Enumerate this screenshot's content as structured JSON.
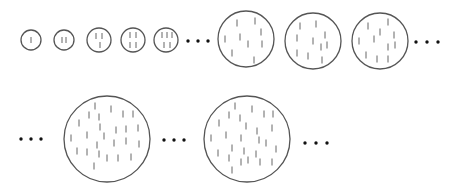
{
  "diagram": {
    "stroke_color": "#555555",
    "tick_color": "#666666",
    "dot_color": "#111111",
    "rows": [
      {
        "items": [
          {
            "type": "circle",
            "cx": 31,
            "cy": 40,
            "r": 10,
            "ticks": [
              [
                31,
                40
              ]
            ]
          },
          {
            "type": "circle",
            "cx": 64,
            "cy": 40,
            "r": 10,
            "ticks": [
              [
                62,
                40
              ],
              [
                66,
                40
              ]
            ]
          },
          {
            "type": "circle",
            "cx": 99,
            "cy": 40,
            "r": 12,
            "ticks": [
              [
                96,
                36
              ],
              [
                102,
                36
              ],
              [
                100,
                45
              ]
            ]
          },
          {
            "type": "circle",
            "cx": 133,
            "cy": 40,
            "r": 12,
            "ticks": [
              [
                130,
                35
              ],
              [
                136,
                35
              ],
              [
                130,
                45
              ],
              [
                136,
                45
              ]
            ]
          },
          {
            "type": "circle",
            "cx": 166,
            "cy": 40,
            "r": 12,
            "ticks": [
              [
                162,
                35
              ],
              [
                167,
                35
              ],
              [
                172,
                35
              ],
              [
                164,
                45
              ],
              [
                170,
                45
              ]
            ]
          },
          {
            "type": "ellipsis",
            "x": 188,
            "y": 41,
            "gap": 10
          },
          {
            "type": "circle",
            "cx": 246,
            "cy": 39,
            "r": 28,
            "ticks": [
              [
                237,
                23
              ],
              [
                255,
                21
              ],
              [
                225,
                39
              ],
              [
                240,
                37
              ],
              [
                261,
                32
              ],
              [
                248,
                44
              ],
              [
                262,
                44
              ],
              [
                232,
                53
              ],
              [
                254,
                60
              ]
            ]
          },
          {
            "type": "circle",
            "cx": 313,
            "cy": 41,
            "r": 28,
            "ticks": [
              [
                300,
                26
              ],
              [
                316,
                24
              ],
              [
                297,
                38
              ],
              [
                313,
                41
              ],
              [
                325,
                35
              ],
              [
                321,
                47
              ],
              [
                327,
                45
              ],
              [
                297,
                53
              ],
              [
                308,
                56
              ],
              [
                322,
                60
              ]
            ]
          },
          {
            "type": "circle",
            "cx": 380,
            "cy": 41,
            "r": 28,
            "ticks": [
              [
                368,
                26
              ],
              [
                388,
                22
              ],
              [
                380,
                32
              ],
              [
                394,
                35
              ],
              [
                359,
                41
              ],
              [
                374,
                39
              ],
              [
                388,
                47
              ],
              [
                395,
                45
              ],
              [
                366,
                55
              ],
              [
                377,
                59
              ],
              [
                388,
                59
              ]
            ]
          },
          {
            "type": "ellipsis",
            "x": 416,
            "y": 42,
            "gap": 11
          }
        ]
      },
      {
        "items": [
          {
            "type": "ellipsis",
            "x": 21,
            "y": 139,
            "gap": 10
          },
          {
            "type": "circle",
            "cx": 107,
            "cy": 139,
            "r": 43,
            "ticks": [
              [
                95,
                106
              ],
              [
                111,
                109
              ],
              [
                89,
                115
              ],
              [
                99,
                117
              ],
              [
                123,
                114
              ],
              [
                133,
                114
              ],
              [
                79,
                123
              ],
              [
                100,
                127
              ],
              [
                116,
                130
              ],
              [
                126,
                129
              ],
              [
                138,
                128
              ],
              [
                71,
                138
              ],
              [
                87,
                135
              ],
              [
                104,
                136
              ],
              [
                97,
                145
              ],
              [
                114,
                143
              ],
              [
                126,
                141
              ],
              [
                139,
                144
              ],
              [
                77,
                151
              ],
              [
                87,
                152
              ],
              [
                99,
                154
              ],
              [
                107,
                158
              ],
              [
                118,
                158
              ],
              [
                131,
                157
              ],
              [
                94,
                166
              ]
            ]
          },
          {
            "type": "ellipsis",
            "x": 164,
            "y": 140,
            "gap": 10
          },
          {
            "type": "circle",
            "cx": 247,
            "cy": 139,
            "r": 43,
            "ticks": [
              [
                235,
                106
              ],
              [
                252,
                109
              ],
              [
                229,
                115
              ],
              [
                240,
                118
              ],
              [
                264,
                114
              ],
              [
                273,
                114
              ],
              [
                219,
                123
              ],
              [
                246,
                126
              ],
              [
                257,
                131
              ],
              [
                272,
                128
              ],
              [
                211,
                138
              ],
              [
                226,
                135
              ],
              [
                241,
                138
              ],
              [
                259,
                140
              ],
              [
                266,
                143
              ],
              [
                276,
                149
              ],
              [
                232,
                148
              ],
              [
                244,
                151
              ],
              [
                256,
                154
              ],
              [
                218,
                153
              ],
              [
                229,
                158
              ],
              [
                241,
                162
              ],
              [
                248,
                160
              ],
              [
                260,
                162
              ],
              [
                272,
                162
              ],
              [
                232,
                170
              ]
            ]
          },
          {
            "type": "ellipsis",
            "x": 305,
            "y": 143,
            "gap": 11
          }
        ]
      }
    ]
  }
}
